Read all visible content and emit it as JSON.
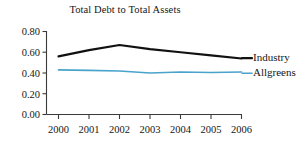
{
  "chart_data": {
    "type": "line",
    "title": "Total Debt to Total Assets",
    "xlabel": "",
    "ylabel": "",
    "categories": [
      "2000",
      "2001",
      "2002",
      "2003",
      "2004",
      "2005",
      "2006"
    ],
    "x": [
      2000,
      2001,
      2002,
      2003,
      2004,
      2005,
      2006
    ],
    "series": [
      {
        "name": "Industry",
        "color": "#111111",
        "values": [
          0.56,
          0.62,
          0.67,
          0.63,
          0.6,
          0.57,
          0.54
        ]
      },
      {
        "name": "Allgreens",
        "color": "#49A3CB",
        "values": [
          0.43,
          0.425,
          0.42,
          0.4,
          0.41,
          0.405,
          0.41
        ]
      }
    ],
    "ylim": [
      0.0,
      0.8
    ],
    "ytick_values": [
      0.0,
      0.2,
      0.4,
      0.6,
      0.8
    ],
    "ytick_labels": [
      "0.00",
      "0.20",
      "0.40",
      "0.60",
      "0.80"
    ],
    "xtick_labels": [
      "2000",
      "2001",
      "2002",
      "2003",
      "2004",
      "2005",
      "2006"
    ],
    "grid": false,
    "legend_position": "right-inline",
    "legend_entries": [
      "Industry",
      "Allgreens"
    ]
  }
}
